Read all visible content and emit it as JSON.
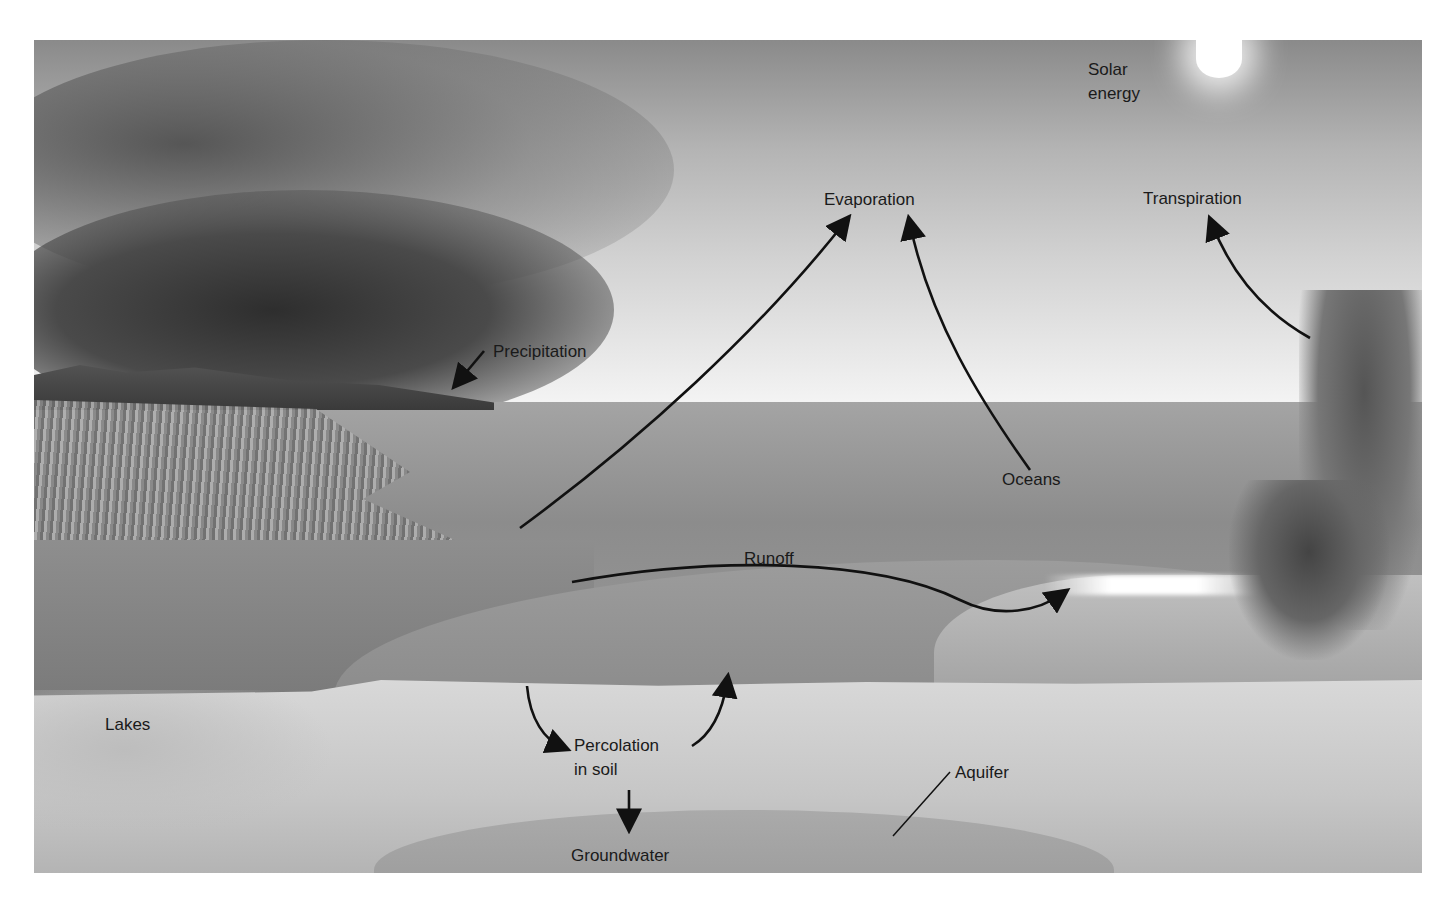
{
  "diagram": {
    "style": "grayscale illustration",
    "labels": {
      "solar_energy": "Solar\nenergy",
      "evaporation": "Evaporation",
      "transpiration": "Transpiration",
      "precipitation": "Precipitation",
      "oceans": "Oceans",
      "runoff": "Runoff",
      "lakes": "Lakes",
      "percolation": "Percolation\nin soil",
      "aquifer": "Aquifer",
      "groundwater": "Groundwater"
    },
    "arrows": [
      {
        "from": "lake",
        "to": "evaporation"
      },
      {
        "from": "oceans",
        "to": "evaporation"
      },
      {
        "from": "palm trees",
        "to": "transpiration"
      },
      {
        "from": "precipitation label",
        "to": "clouds/rain"
      },
      {
        "from": "lake",
        "to": "ocean",
        "label": "runoff"
      },
      {
        "from": "surface",
        "to": "percolation in soil"
      },
      {
        "from": "percolation in soil",
        "to": "surface"
      },
      {
        "from": "percolation in soil",
        "to": "groundwater"
      }
    ]
  }
}
